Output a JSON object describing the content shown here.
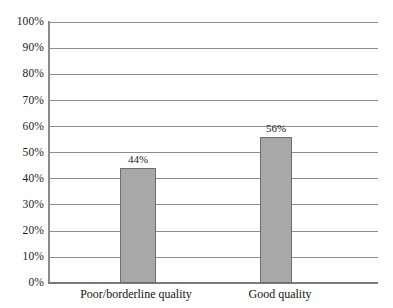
{
  "chart_data": {
    "type": "bar",
    "title": "",
    "subtitle": "",
    "xlabel": "",
    "ylabel": "",
    "categories": [
      "Poor/borderline quality",
      "Good quality"
    ],
    "values": [
      44,
      56
    ],
    "value_labels": [
      "44%",
      "56%"
    ],
    "ylim": [
      0,
      100
    ],
    "ytick_values": [
      0,
      10,
      20,
      30,
      40,
      50,
      60,
      70,
      80,
      90,
      100
    ],
    "ytick_labels": [
      "0%",
      "10%",
      "20%",
      "30%",
      "40%",
      "50%",
      "60%",
      "70%",
      "80%",
      "90%",
      "100%"
    ],
    "grid": "horizontal",
    "legend": "none",
    "orientation": "vertical",
    "units": "percent",
    "series": [
      {
        "name": "",
        "values": [
          44,
          56
        ],
        "bar_fill": "#a8a8a8",
        "bar_border": "#6e6e6e"
      }
    ]
  },
  "style": {
    "background": "#ffffff",
    "gridline_color": "#8e8e8e",
    "axis_color": "#8a8a8a",
    "text_color": "#1a1a1a"
  },
  "artifacts": {
    "cropped_title_remnant": ""
  }
}
